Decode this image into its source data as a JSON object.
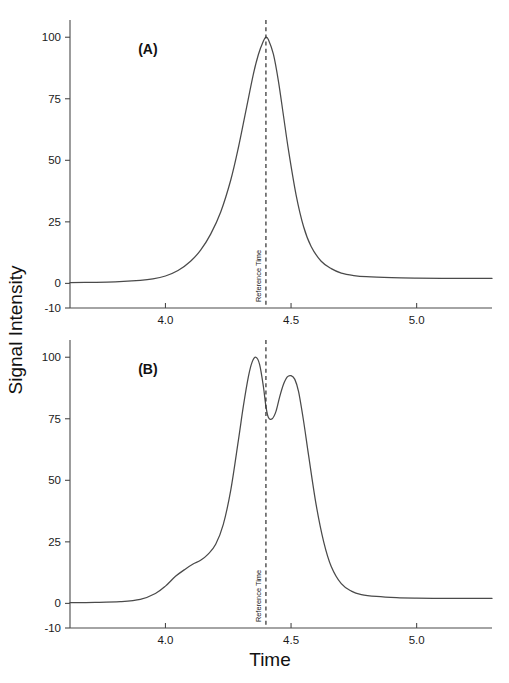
{
  "figure": {
    "background_color": "#ffffff",
    "line_color": "#4a4a4a",
    "text_color": "#1a1a1a",
    "axis_x_title": "Time",
    "axis_y_title": "Signal Intensity"
  },
  "chart_data": {
    "type": "line",
    "title": "",
    "xlabel": "Time",
    "ylabel": "Signal Intensity",
    "xlim": [
      3.62,
      5.3
    ],
    "ylim": [
      -10,
      107
    ],
    "grid": false,
    "legend_position": "none",
    "xticks": [
      4.0,
      4.5,
      5.0
    ],
    "xtick_labels": [
      "4.0",
      "4.5",
      "5.0"
    ],
    "yticks": [
      -10,
      0,
      25,
      50,
      75,
      100
    ],
    "ytick_labels": [
      "-10",
      "0",
      "25",
      "50",
      "75",
      "100"
    ],
    "panels": [
      {
        "tag": "(A)",
        "tag_x": 3.93,
        "tag_y": 93,
        "annotation": {
          "text": "Reference Time",
          "x": 4.4,
          "style": "dashed vertical line, rotated label"
        },
        "description": "Single symmetric-tailed chromatographic peak maximum at the reference time",
        "series": [
          {
            "name": "Signal A",
            "x": [
              3.62,
              3.7,
              3.8,
              3.9,
              3.95,
              4.0,
              4.05,
              4.1,
              4.14,
              4.18,
              4.22,
              4.26,
              4.29,
              4.32,
              4.35,
              4.37,
              4.39,
              4.4,
              4.41,
              4.43,
              4.45,
              4.47,
              4.49,
              4.52,
              4.55,
              4.58,
              4.62,
              4.66,
              4.7,
              4.75,
              4.8,
              4.9,
              5.0,
              5.1,
              5.2,
              5.3
            ],
            "y": [
              0.3,
              0.4,
              0.6,
              1.2,
              1.8,
              3.0,
              5.2,
              9.0,
              13.5,
              20.0,
              29.0,
              42.0,
              55.0,
              70.0,
              85.0,
              93.0,
              98.5,
              100.0,
              99.0,
              93.0,
              82.0,
              68.0,
              54.0,
              36.0,
              23.0,
              15.0,
              9.0,
              6.0,
              4.2,
              3.2,
              2.7,
              2.3,
              2.1,
              2.0,
              2.0,
              2.0
            ]
          }
        ]
      },
      {
        "tag": "(B)",
        "tag_x": 3.93,
        "tag_y": 93,
        "annotation": {
          "text": "Reference Time",
          "x": 4.4,
          "style": "dashed vertical line, rotated label"
        },
        "description": "Resolved doublet with a front shoulder near 4.1; valley falls on the reference time",
        "series": [
          {
            "name": "Signal B",
            "x": [
              3.62,
              3.72,
              3.82,
              3.9,
              3.96,
              4.0,
              4.04,
              4.08,
              4.11,
              4.14,
              4.17,
              4.2,
              4.23,
              4.26,
              4.29,
              4.31,
              4.33,
              4.345,
              4.36,
              4.375,
              4.39,
              4.4,
              4.41,
              4.425,
              4.44,
              4.455,
              4.47,
              4.485,
              4.5,
              4.515,
              4.53,
              4.55,
              4.57,
              4.6,
              4.63,
              4.66,
              4.7,
              4.74,
              4.78,
              4.84,
              4.92,
              5.0,
              5.1,
              5.2,
              5.3
            ],
            "y": [
              0.3,
              0.4,
              0.7,
              1.6,
              4.0,
              7.0,
              11.0,
              14.0,
              16.0,
              17.5,
              20.0,
              24.0,
              32.0,
              46.0,
              66.0,
              80.0,
              92.0,
              98.0,
              100.0,
              97.0,
              88.0,
              80.0,
              75.5,
              75.0,
              78.0,
              84.0,
              89.0,
              92.0,
              92.5,
              91.0,
              86.0,
              74.0,
              60.0,
              40.0,
              25.0,
              15.0,
              8.0,
              5.0,
              3.6,
              2.8,
              2.3,
              2.1,
              2.0,
              2.0,
              2.0
            ]
          }
        ]
      }
    ]
  }
}
